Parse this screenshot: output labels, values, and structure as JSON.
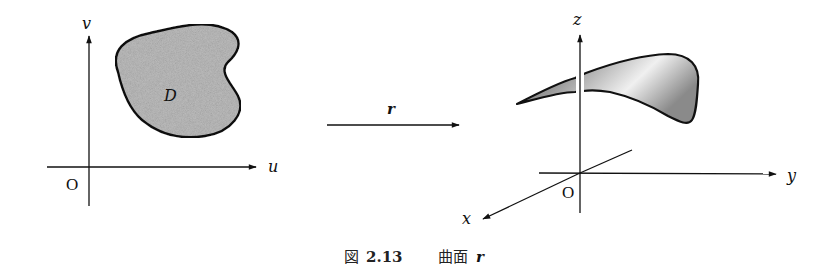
{
  "left_panel": {
    "axis_u_label": "u",
    "axis_v_label": "v",
    "origin_label": "O",
    "region_label": "D"
  },
  "mapping": {
    "arrow_label": "r"
  },
  "right_panel": {
    "axis_x_label": "x",
    "axis_y_label": "y",
    "axis_z_label": "z",
    "origin_label": "O"
  },
  "caption": {
    "prefix": "図",
    "number": "2.13",
    "title": "曲面",
    "symbol": "r"
  },
  "colors": {
    "region_fill": "#bdbdbd",
    "surface_dark": "#6e6e6e",
    "surface_light": "#f2f2f2",
    "line": "#111111"
  }
}
